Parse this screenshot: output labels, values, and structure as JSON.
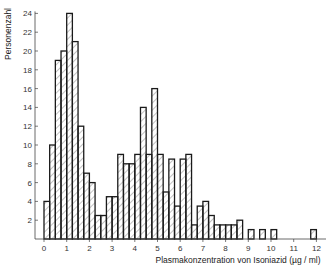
{
  "chart_data": {
    "type": "bar",
    "subtype": "histogram",
    "title": "",
    "xlabel": "Plasmakonzentration von Isoniazid (µg / ml)",
    "ylabel": "Personenzahl",
    "xlim": [
      0,
      12.5
    ],
    "ylim": [
      0,
      24
    ],
    "x_ticks": [
      0,
      1,
      2,
      3,
      4,
      5,
      6,
      7,
      8,
      9,
      10,
      11,
      12
    ],
    "y_ticks": [
      2,
      4,
      6,
      8,
      10,
      12,
      14,
      16,
      18,
      20,
      22,
      24
    ],
    "grid": false,
    "legend": null,
    "bin_width": 0.25,
    "bins": [
      {
        "x": 0.0,
        "count": 4
      },
      {
        "x": 0.25,
        "count": 10
      },
      {
        "x": 0.5,
        "count": 19
      },
      {
        "x": 0.75,
        "count": 20
      },
      {
        "x": 1.0,
        "count": 24
      },
      {
        "x": 1.25,
        "count": 21
      },
      {
        "x": 1.5,
        "count": 12
      },
      {
        "x": 1.75,
        "count": 7
      },
      {
        "x": 2.0,
        "count": 6
      },
      {
        "x": 2.25,
        "count": 2.5
      },
      {
        "x": 2.5,
        "count": 2.5
      },
      {
        "x": 2.75,
        "count": 4.5
      },
      {
        "x": 3.0,
        "count": 4.5
      },
      {
        "x": 3.25,
        "count": 9
      },
      {
        "x": 3.5,
        "count": 8
      },
      {
        "x": 3.75,
        "count": 8
      },
      {
        "x": 4.0,
        "count": 9
      },
      {
        "x": 4.25,
        "count": 14
      },
      {
        "x": 4.5,
        "count": 9
      },
      {
        "x": 4.75,
        "count": 16
      },
      {
        "x": 5.0,
        "count": 9
      },
      {
        "x": 5.25,
        "count": 5
      },
      {
        "x": 5.5,
        "count": 8.5
      },
      {
        "x": 5.75,
        "count": 3.5
      },
      {
        "x": 6.0,
        "count": 8.5
      },
      {
        "x": 6.25,
        "count": 9
      },
      {
        "x": 6.5,
        "count": 1.5
      },
      {
        "x": 6.75,
        "count": 3.5
      },
      {
        "x": 7.0,
        "count": 4
      },
      {
        "x": 7.25,
        "count": 2.5
      },
      {
        "x": 7.5,
        "count": 1.5
      },
      {
        "x": 7.75,
        "count": 1.5
      },
      {
        "x": 8.0,
        "count": 1.5
      },
      {
        "x": 8.25,
        "count": 1.5
      },
      {
        "x": 8.5,
        "count": 2
      },
      {
        "x": 8.75,
        "count": 0
      },
      {
        "x": 9.0,
        "count": 1
      },
      {
        "x": 9.25,
        "count": 0
      },
      {
        "x": 9.5,
        "count": 1
      },
      {
        "x": 10.0,
        "count": 1
      },
      {
        "x": 11.75,
        "count": 1
      }
    ],
    "fill": "diagonal-hatch",
    "colors": {
      "outline": "#1a1a1a",
      "hatch": "#555555",
      "axis": "#444444"
    }
  }
}
